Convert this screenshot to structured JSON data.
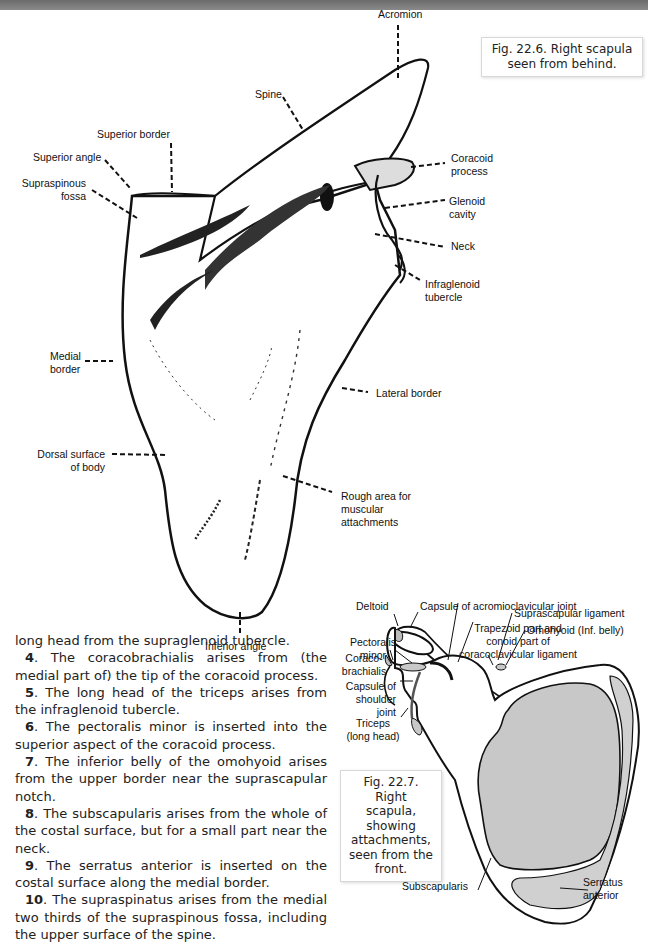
{
  "header": {
    "title_partial": "BONES OF THE ..."
  },
  "figure_1": {
    "caption": "Fig. 22.6. Right scapula seen from behind.",
    "caption_line1": "Fig. 22.6. Right scapula",
    "caption_line2": "seen from behind.",
    "labels": {
      "acromion": "Acromion",
      "spine": "Spine",
      "superior_border": "Superior border",
      "superior_angle": "Superior angle",
      "supraspinous_fossa_1": "Supraspinous",
      "supraspinous_fossa_2": "fossa",
      "coracoid_process_1": "Coracoid",
      "coracoid_process_2": "process",
      "glenoid_cavity_1": "Glenoid",
      "glenoid_cavity_2": "cavity",
      "neck": "Neck",
      "infraglenoid_tubercle_1": "Infraglenoid",
      "infraglenoid_tubercle_2": "tubercle",
      "medial_border_1": "Medial",
      "medial_border_2": "border",
      "lateral_border": "Lateral border",
      "dorsal_surface_1": "Dorsal surface",
      "dorsal_surface_2": "of body",
      "rough_area_1": "Rough area for",
      "rough_area_2": "muscular",
      "rough_area_3": "attachments",
      "inferior_angle": "Inferior angle"
    }
  },
  "figure_2": {
    "caption": "Fig. 22.7. Right scapula, showing attachments, seen from the front.",
    "caption_lines": [
      "Fig. 22.7. Right",
      "scapula, showing",
      "attachments,",
      "seen from the",
      "front."
    ],
    "labels": {
      "deltoid": "Deltoid",
      "capsule_acromioclavicular": "Capsule of acromioclavicular joint",
      "trapezoid_1": "Trapezoid part and",
      "trapezoid_2": "conoid part of",
      "trapezoid_3": "coracoclavicular ligament",
      "pectoralis_minor_1": "Pectoralis",
      "pectoralis_minor_2": "minor",
      "suprascapular_ligament": "Suprascapular ligament",
      "omohyoid": "Omohyoid (Inf. belly)",
      "coracobrachialis_1": "Coraco-",
      "coracobrachialis_2": "brachialis",
      "capsule_shoulder_1": "Capsule of",
      "capsule_shoulder_2": "shoulder",
      "capsule_shoulder_3": "joint",
      "triceps_1": "Triceps",
      "triceps_2": "(long head)",
      "subscapularis": "Subscapularis",
      "serratus_1": "Serratus",
      "serratus_2": "anterior"
    }
  },
  "body_text": {
    "intro": "long head from the supraglenoid tubercle.",
    "items": [
      {
        "num": "4",
        "text": ". The coracobrachialis arises from (the medial part of) the tip of the coracoid process."
      },
      {
        "num": "5",
        "text": ". The long head of the triceps arises from the infraglenoid tubercle."
      },
      {
        "num": "6",
        "text": ". The pectoralis minor is inserted into the superior aspect of the coracoid process."
      },
      {
        "num": "7",
        "text": ". The inferior belly of the omohyoid arises from the upper border near the suprascapular notch."
      },
      {
        "num": "8",
        "text": ". The subscapularis arises from the whole of the costal surface, but for a small part near the neck."
      },
      {
        "num": "9",
        "text": ". The serratus anterior is inserted on the costal surface along the medial border."
      },
      {
        "num": "10",
        "text": ". The supraspinatus arises from the medial two thirds of the supraspinous fossa, including the upper surface of the spine."
      }
    ]
  },
  "colors": {
    "header_bar": "#7a7a7a",
    "attachment_fill": "#c8c8c8",
    "outline": "#111111"
  }
}
